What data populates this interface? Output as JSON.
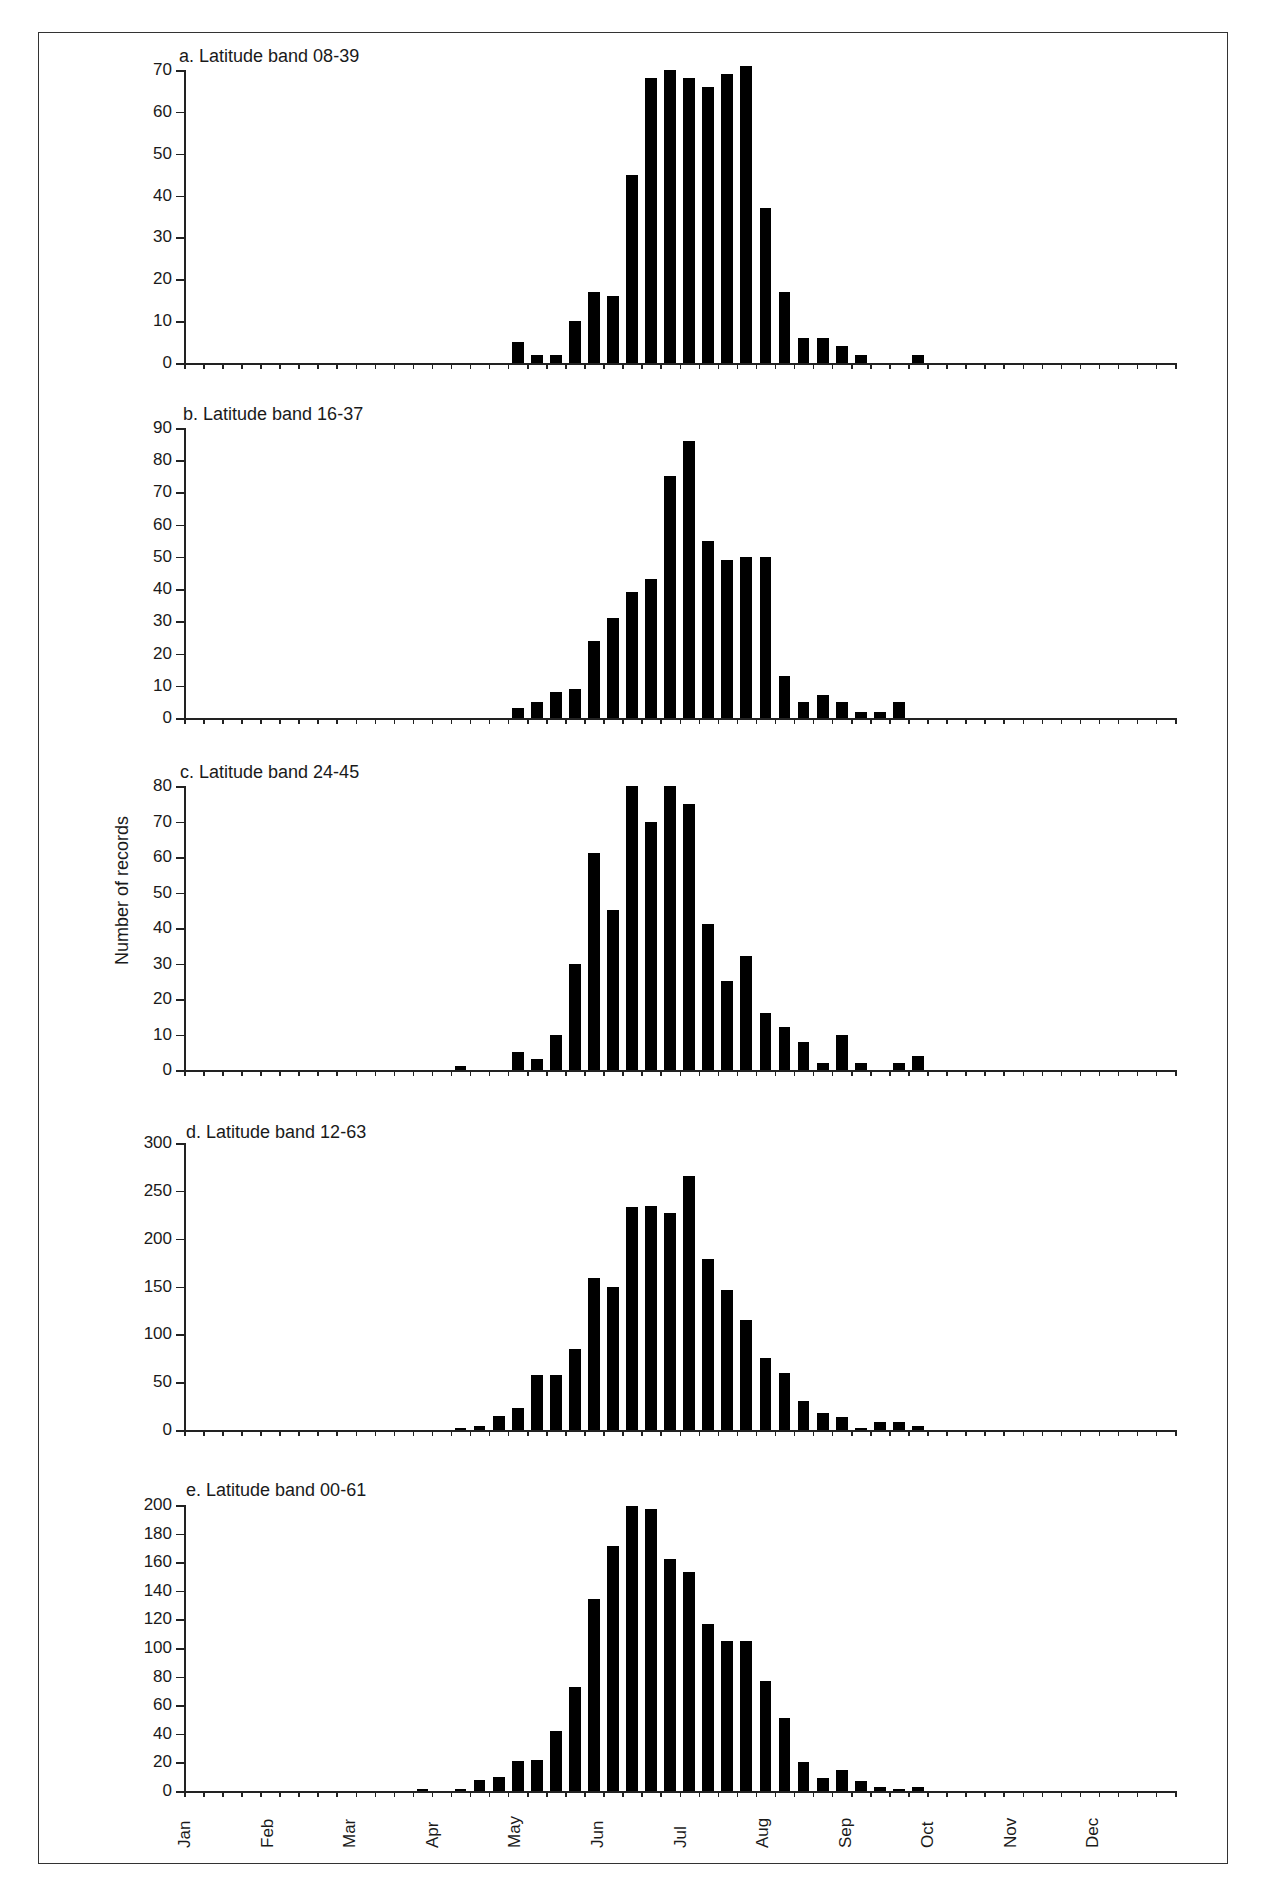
{
  "figure": {
    "ylabel": "Number of records",
    "months": [
      "Jan",
      "Feb",
      "Mar",
      "Apr",
      "May",
      "Jun",
      "Jul",
      "Aug",
      "Sep",
      "Oct",
      "Nov",
      "Dec"
    ]
  },
  "chart_data": [
    {
      "type": "bar",
      "title": "a.  Latitude band 08-39",
      "xlabel": "Week of year (Jan–Dec)",
      "ylabel": "Number of records",
      "ylim": [
        0,
        70
      ],
      "yticks": [
        0,
        10,
        20,
        30,
        40,
        50,
        60,
        70
      ],
      "n_bins": 52,
      "start_bin": 17,
      "values": [
        5,
        2,
        2,
        10,
        17,
        16,
        45,
        68,
        70,
        68,
        66,
        69,
        71,
        37,
        17,
        6,
        6,
        4,
        2,
        0,
        0,
        2
      ],
      "grid": false
    },
    {
      "type": "bar",
      "title": "b.  Latitude band 16-37",
      "xlabel": "Week of year (Jan–Dec)",
      "ylabel": "Number of records",
      "ylim": [
        0,
        90
      ],
      "yticks": [
        0,
        10,
        20,
        30,
        40,
        50,
        60,
        70,
        80,
        90
      ],
      "n_bins": 52,
      "start_bin": 17,
      "values": [
        3,
        5,
        8,
        9,
        24,
        31,
        39,
        43,
        75,
        86,
        55,
        49,
        50,
        50,
        13,
        5,
        7,
        5,
        2,
        2,
        5
      ],
      "grid": false
    },
    {
      "type": "bar",
      "title": "c.  Latitude band 24-45",
      "xlabel": "Week of year (Jan–Dec)",
      "ylabel": "Number of records",
      "ylim": [
        0,
        80
      ],
      "yticks": [
        0,
        10,
        20,
        30,
        40,
        50,
        60,
        70,
        80
      ],
      "n_bins": 52,
      "start_bin": 14,
      "values": [
        1,
        0,
        0,
        5,
        3,
        10,
        30,
        61,
        45,
        80,
        70,
        80,
        75,
        41,
        25,
        32,
        16,
        12,
        8,
        2,
        10,
        2,
        0,
        2,
        4
      ],
      "grid": false
    },
    {
      "type": "bar",
      "title": "d.  Latitude band 12-63",
      "xlabel": "Week of year (Jan–Dec)",
      "ylabel": "Number of records",
      "ylim": [
        0,
        300
      ],
      "yticks": [
        0,
        50,
        100,
        150,
        200,
        250,
        300
      ],
      "n_bins": 52,
      "start_bin": 14,
      "values": [
        2,
        4,
        15,
        23,
        58,
        58,
        85,
        159,
        149,
        233,
        234,
        227,
        265,
        179,
        146,
        115,
        75,
        60,
        30,
        18,
        14,
        2,
        8,
        8,
        4
      ],
      "grid": false
    },
    {
      "type": "bar",
      "title": "e.  Latitude band 00-61",
      "xlabel": "Week of year (Jan–Dec)",
      "ylabel": "Number of records",
      "ylim": [
        0,
        200
      ],
      "yticks": [
        0,
        20,
        40,
        60,
        80,
        100,
        120,
        140,
        160,
        180,
        200
      ],
      "n_bins": 52,
      "start_bin": 12,
      "values": [
        1,
        0,
        1,
        8,
        10,
        21,
        22,
        42,
        73,
        134,
        171,
        199,
        197,
        162,
        153,
        117,
        105,
        105,
        77,
        51,
        20,
        9,
        15,
        7,
        3,
        1,
        3
      ],
      "grid": false
    }
  ]
}
